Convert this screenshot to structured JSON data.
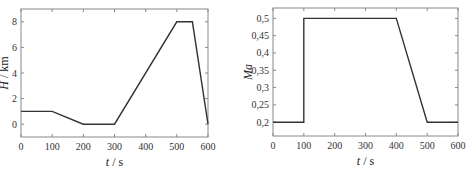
{
  "chart_data": [
    {
      "type": "line",
      "title": "",
      "xlabel_var": "t",
      "xlabel_unit": "s",
      "ylabel_var": "H",
      "ylabel_unit": "km",
      "xlim": [
        0,
        600
      ],
      "ylim": [
        -1,
        9
      ],
      "xticks": [
        0,
        100,
        200,
        300,
        400,
        500,
        600
      ],
      "yticks": [
        0,
        2,
        4,
        6,
        8
      ],
      "grid": false,
      "x": [
        0,
        100,
        200,
        300,
        500,
        550,
        600
      ],
      "y": [
        1,
        1,
        0,
        0,
        8,
        8,
        0
      ]
    },
    {
      "type": "line",
      "title": "",
      "xlabel_var": "t",
      "xlabel_unit": "s",
      "ylabel_var": "Ma",
      "ylabel_unit": "",
      "xlim": [
        0,
        600
      ],
      "ylim": [
        0.16,
        0.53
      ],
      "xticks": [
        0,
        100,
        200,
        300,
        400,
        500,
        600
      ],
      "yticks": [
        "0.2",
        "0.25",
        "0.3",
        "0.35",
        "0.4",
        "0.45",
        "0.5"
      ],
      "ytick_labels": [
        "0,2",
        "0,25",
        "0,3",
        "0,35",
        "0,4",
        "0,45",
        "0,5"
      ],
      "grid": false,
      "x": [
        0,
        100,
        100,
        400,
        500,
        600
      ],
      "y": [
        0.2,
        0.2,
        0.5,
        0.5,
        0.2,
        0.2
      ]
    }
  ],
  "colors": {
    "line": "#333333",
    "axis": "#888888"
  }
}
